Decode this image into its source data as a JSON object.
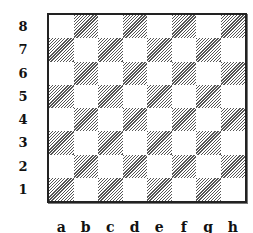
{
  "diagram": {
    "type": "chessboard",
    "size": 8,
    "bottom_left_square_color": "dark",
    "dark_square_style": "diagonal-hatch",
    "colors": {
      "border": "#222222",
      "hatch": "#555555",
      "light": "#ffffff"
    },
    "ranks": [
      "8",
      "7",
      "6",
      "5",
      "4",
      "3",
      "2",
      "1"
    ],
    "files": [
      "a",
      "b",
      "c",
      "d",
      "e",
      "f",
      "g",
      "h"
    ],
    "pieces": []
  }
}
